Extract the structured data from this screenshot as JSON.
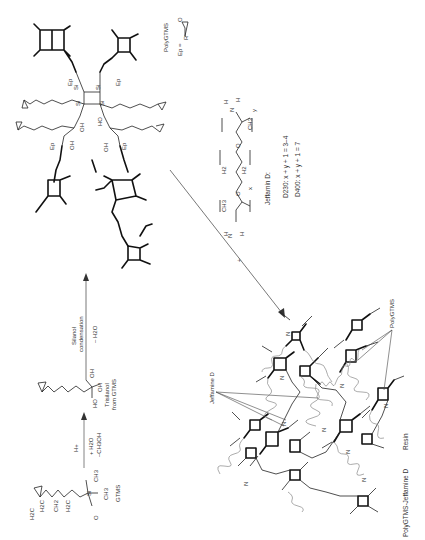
{
  "scheme": {
    "step1": {
      "reactant_label": "GTMS",
      "reactant_atoms": [
        "H2C",
        "O",
        "CH",
        "H2C",
        "O",
        "CH2",
        "H2C",
        "Si",
        "O",
        "CH3",
        "CH3",
        "O",
        "CH3",
        "O",
        "CH3"
      ],
      "arrow_above": "H+",
      "arrow_below_1": "+ H2O",
      "arrow_below_2": "–CH3OH"
    },
    "intermediate": {
      "label_1": "Trisilanol",
      "label_2": "from GTMS",
      "atoms": [
        "O",
        "O",
        "Si",
        "OH",
        "OH",
        "HO"
      ]
    },
    "step2": {
      "arrow_above_1": "Silanol",
      "arrow_above_2": "condensation",
      "arrow_below": "– H2O"
    },
    "polygtms": {
      "label": "PolyGTMS",
      "ep_definition": "Ep =",
      "ep_r": "R",
      "ep_o": "O",
      "si_labels": [
        "Si",
        "Si",
        "Si",
        "Si",
        "Si",
        "Si",
        "Si",
        "Si"
      ],
      "substituent_labels": [
        "Ep",
        "Ep",
        "OH",
        "HO",
        "OH",
        "Ep",
        "OH",
        "Ep"
      ]
    },
    "jeffamine": {
      "plus": "+",
      "name": "Jeffamin D:",
      "d230": "D230: x + y + 1 = 3–4",
      "d400": "D400: x + y + 1 = 7",
      "atoms": [
        "H",
        "N",
        "H",
        "CH3",
        "O",
        "H2",
        "C",
        "C",
        "H2",
        "O",
        "CH3",
        "N",
        "H",
        "H"
      ],
      "subscripts": [
        "x",
        "y"
      ]
    },
    "resin": {
      "label_jeffamine": "Jeffamine D",
      "label_polygtms": "PolyGTMS",
      "caption_1": "PolyGTMS-Jeffamine D",
      "caption_2": "Resin",
      "n_label": "N"
    }
  }
}
